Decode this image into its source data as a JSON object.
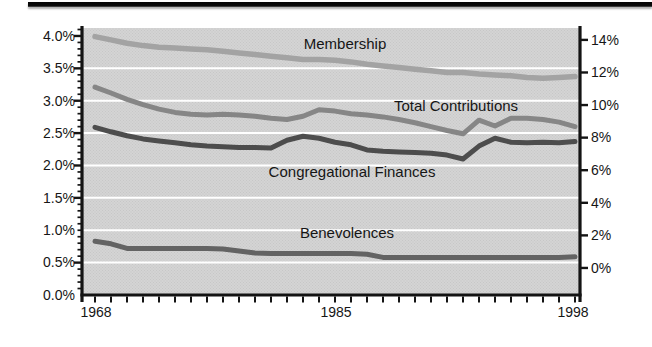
{
  "figure": {
    "top_rule_color": "#0a0a0a",
    "background": "#ffffff",
    "plot_background": "#d4d4d4",
    "plot_dither_color": "#c7c7c7",
    "gridline_color": "#ffffff",
    "axis_color": "#141414",
    "text_color": "#161616"
  },
  "chart_data": {
    "type": "line",
    "title": "",
    "x": [
      1968,
      1969,
      1970,
      1971,
      1972,
      1973,
      1974,
      1975,
      1976,
      1977,
      1978,
      1979,
      1980,
      1981,
      1982,
      1983,
      1984,
      1985,
      1986,
      1987,
      1988,
      1989,
      1990,
      1991,
      1992,
      1993,
      1994,
      1995,
      1996,
      1997,
      1998
    ],
    "x_axis": {
      "ticklabels": [
        {
          "text": "1968",
          "x": 96
        },
        {
          "text": "1985",
          "x": 336
        },
        {
          "text": "1998",
          "x": 573
        }
      ]
    },
    "left_axis": {
      "min": 0,
      "max": 4.123,
      "unit": "%",
      "ticks": [
        {
          "label": "0.0%",
          "value": 0.0
        },
        {
          "label": "0.5%",
          "value": 0.5
        },
        {
          "label": "1.0%",
          "value": 1.0
        },
        {
          "label": "1.5%",
          "value": 1.5
        },
        {
          "label": "2.0%",
          "value": 2.0
        },
        {
          "label": "2.5%",
          "value": 2.5
        },
        {
          "label": "3.0%",
          "value": 3.0
        },
        {
          "label": "3.5%",
          "value": 3.5
        },
        {
          "label": "4.0%",
          "value": 4.0
        }
      ],
      "minor_tick_step": 0.1,
      "gridlines": [
        0.5,
        1.0,
        1.5,
        2.0,
        2.5,
        3.0,
        3.5
      ]
    },
    "right_axis": {
      "min": -1.66,
      "max": 14.73,
      "unit": "%",
      "ticks": [
        {
          "label": "0%",
          "value": 0
        },
        {
          "label": "2%",
          "value": 2
        },
        {
          "label": "4%",
          "value": 4
        },
        {
          "label": "6%",
          "value": 6
        },
        {
          "label": "8%",
          "value": 8
        },
        {
          "label": "10%",
          "value": 10
        },
        {
          "label": "12%",
          "value": 12
        },
        {
          "label": "14%",
          "value": 14
        }
      ]
    },
    "series": [
      {
        "key": "membership",
        "name": "Membership",
        "axis": "right",
        "color": "#a3a3a3",
        "line_width": 5.5,
        "label_pos": {
          "x": 345,
          "y": 44
        },
        "values": [
          14.2,
          14.0,
          13.8,
          13.65,
          13.55,
          13.5,
          13.45,
          13.4,
          13.3,
          13.2,
          13.1,
          13.0,
          12.9,
          12.8,
          12.8,
          12.75,
          12.65,
          12.5,
          12.4,
          12.3,
          12.2,
          12.1,
          12.0,
          12.0,
          11.9,
          11.85,
          11.8,
          11.7,
          11.65,
          11.7,
          11.75
        ]
      },
      {
        "key": "total-contributions",
        "name": "Total Contributions",
        "axis": "left",
        "color": "#868686",
        "line_width": 5,
        "label_pos": {
          "x": 456,
          "y": 106
        },
        "values": [
          3.21,
          3.12,
          3.02,
          2.94,
          2.87,
          2.82,
          2.79,
          2.78,
          2.79,
          2.78,
          2.76,
          2.73,
          2.71,
          2.76,
          2.86,
          2.84,
          2.8,
          2.78,
          2.75,
          2.71,
          2.66,
          2.6,
          2.54,
          2.49,
          2.7,
          2.61,
          2.73,
          2.73,
          2.71,
          2.67,
          2.6
        ]
      },
      {
        "key": "congregational-finances",
        "name": "Congregational Finances",
        "axis": "left",
        "color": "#4d4d4d",
        "line_width": 5,
        "label_pos": {
          "x": 352,
          "y": 172
        },
        "values": [
          2.59,
          2.52,
          2.46,
          2.41,
          2.38,
          2.35,
          2.32,
          2.3,
          2.29,
          2.28,
          2.28,
          2.27,
          2.39,
          2.45,
          2.42,
          2.36,
          2.32,
          2.24,
          2.22,
          2.21,
          2.2,
          2.19,
          2.16,
          2.1,
          2.3,
          2.42,
          2.36,
          2.35,
          2.36,
          2.35,
          2.37
        ]
      },
      {
        "key": "benevolences",
        "name": "Benevolences",
        "axis": "left",
        "color": "#636363",
        "line_width": 5,
        "label_pos": {
          "x": 347,
          "y": 233
        },
        "values": [
          0.83,
          0.79,
          0.72,
          0.72,
          0.72,
          0.72,
          0.72,
          0.72,
          0.71,
          0.68,
          0.65,
          0.64,
          0.64,
          0.64,
          0.64,
          0.64,
          0.64,
          0.63,
          0.58,
          0.58,
          0.58,
          0.58,
          0.58,
          0.58,
          0.58,
          0.58,
          0.58,
          0.58,
          0.58,
          0.58,
          0.59
        ]
      }
    ]
  }
}
